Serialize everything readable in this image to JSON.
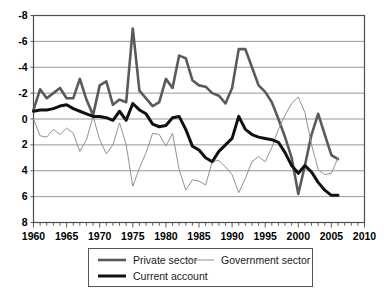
{
  "chart_data": {
    "type": "line",
    "title": "",
    "subtitle": "",
    "xlabel": "",
    "ylabel": "",
    "xlim": [
      1960,
      2010
    ],
    "ylim": [
      -8,
      8
    ],
    "xticks": [
      1960,
      1965,
      1970,
      1975,
      1980,
      1985,
      1990,
      1995,
      2000,
      2005,
      2010
    ],
    "yticks": [
      -8,
      -6,
      -4,
      -2,
      0,
      2,
      4,
      6,
      8
    ],
    "xtick_labels": [
      "1960",
      "1965",
      "1970",
      "1975",
      "1980",
      "1985",
      "1990",
      "1995",
      "2000",
      "2005",
      "2010"
    ],
    "ytick_labels": [
      "8",
      "6",
      "4",
      "2",
      "0",
      "-2",
      "-4",
      "-6",
      "-8"
    ],
    "minor_xtick_interval": 1,
    "grid": "horizontal",
    "legend_position": "bottom",
    "x": [
      1960,
      1961,
      1962,
      1963,
      1964,
      1965,
      1966,
      1967,
      1968,
      1969,
      1970,
      1971,
      1972,
      1973,
      1974,
      1975,
      1976,
      1977,
      1978,
      1979,
      1980,
      1981,
      1982,
      1983,
      1984,
      1985,
      1986,
      1987,
      1988,
      1989,
      1990,
      1991,
      1992,
      1993,
      1994,
      1995,
      1996,
      1997,
      1998,
      1999,
      2000,
      2001,
      2002,
      2003,
      2004,
      2005,
      2006
    ],
    "series": [
      {
        "name": "Private sector",
        "color": "#5a5a5a",
        "width": 2.6,
        "values": [
          0.7,
          2.3,
          1.6,
          2.0,
          2.4,
          1.6,
          1.6,
          3.1,
          1.5,
          0.3,
          2.6,
          2.9,
          1.1,
          1.5,
          1.3,
          7.0,
          2.2,
          1.6,
          1.0,
          1.3,
          3.1,
          2.4,
          4.9,
          4.7,
          3.0,
          2.6,
          2.5,
          2.0,
          1.8,
          1.2,
          2.4,
          5.4,
          5.4,
          4.0,
          2.6,
          2.1,
          1.3,
          0.0,
          -1.4,
          -3.0,
          -5.8,
          -3.6,
          -1.2,
          0.4,
          -1.2,
          -2.8,
          -3.1
        ]
      },
      {
        "name": "Government sector",
        "color": "#919191",
        "width": 1.0,
        "values": [
          0.0,
          -1.3,
          -1.4,
          -0.8,
          -1.2,
          -0.7,
          -1.1,
          -2.5,
          -1.6,
          0.2,
          -1.6,
          -2.7,
          -2.0,
          -0.3,
          -2.0,
          -5.2,
          -3.8,
          -2.6,
          -1.1,
          -1.2,
          -2.1,
          -1.1,
          -3.9,
          -5.5,
          -4.7,
          -4.8,
          -5.1,
          -3.3,
          -3.2,
          -3.7,
          -4.3,
          -5.7,
          -4.6,
          -3.3,
          -2.9,
          -3.3,
          -2.2,
          -0.8,
          0.3,
          1.2,
          1.7,
          0.5,
          -2.0,
          -3.9,
          -4.3,
          -4.2,
          -3.0
        ]
      },
      {
        "name": "Current account",
        "color": "#111111",
        "width": 3.0,
        "values": [
          0.6,
          0.7,
          0.7,
          0.8,
          1.0,
          1.1,
          0.8,
          0.6,
          0.4,
          0.2,
          0.2,
          0.1,
          -0.1,
          0.6,
          -0.1,
          1.2,
          0.7,
          0.4,
          -0.4,
          -0.6,
          -0.5,
          0.1,
          0.2,
          -0.8,
          -2.1,
          -2.4,
          -3.0,
          -3.3,
          -2.5,
          -2.0,
          -1.5,
          0.2,
          -0.8,
          -1.2,
          -1.4,
          -1.5,
          -1.6,
          -1.8,
          -2.6,
          -3.6,
          -4.2,
          -3.6,
          -4.1,
          -4.9,
          -5.5,
          -5.9,
          -5.9
        ]
      }
    ]
  },
  "legend": {
    "entries": [
      {
        "label": "Private sector",
        "series": "Private sector"
      },
      {
        "label": "Government sector",
        "series": "Government sector"
      },
      {
        "label": "Current account",
        "series": "Current account"
      }
    ]
  }
}
